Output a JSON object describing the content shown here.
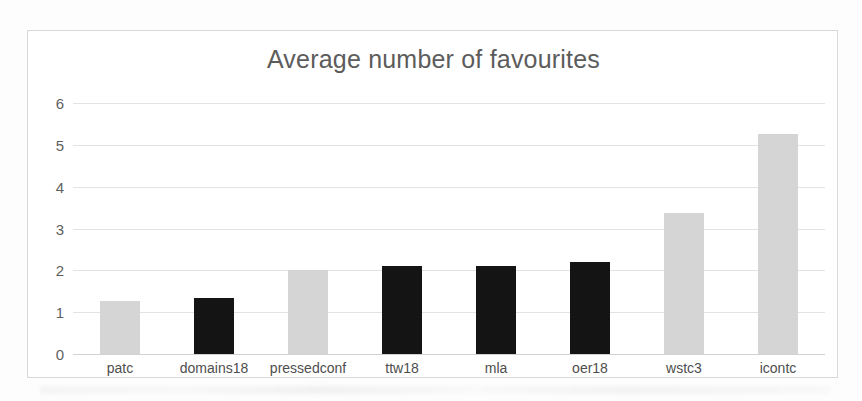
{
  "chart_data": {
    "type": "bar",
    "title": "Average number of favourites",
    "xlabel": "",
    "ylabel": "",
    "categories": [
      "patc",
      "domains18",
      "pressedconf",
      "ttw18",
      "mla",
      "oer18",
      "wstc3",
      "icontc"
    ],
    "values": [
      1.27,
      1.35,
      2.0,
      2.1,
      2.1,
      2.2,
      3.37,
      5.27
    ],
    "bar_colors": [
      "#d5d5d5",
      "#141414",
      "#d5d5d5",
      "#141414",
      "#141414",
      "#141414",
      "#d5d5d5",
      "#d5d5d5"
    ],
    "ylim": [
      0,
      6
    ],
    "yticks": [
      6,
      5,
      4,
      3,
      2,
      1,
      0
    ],
    "ytick_labels": [
      "6",
      "5",
      "4",
      "3",
      "2",
      "1",
      "0"
    ],
    "grid": true,
    "legend": false,
    "legend_position": "none"
  },
  "colors": {
    "bar_light": "#d5d5d5",
    "bar_dark": "#141414",
    "gridline": "#e3e3e3",
    "frame_border": "#d8d8d8",
    "title_text": "#5c5c5c",
    "tick_text": "#5f5f5f",
    "page_background": "#fdfdfd"
  }
}
